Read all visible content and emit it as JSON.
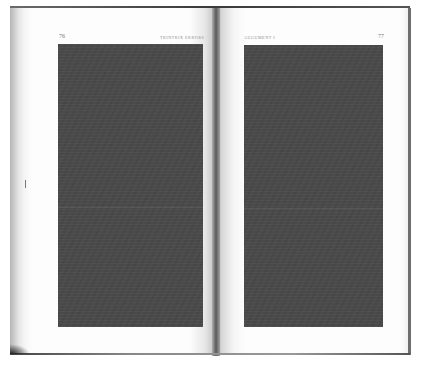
{
  "document": {
    "type": "scanned-book-spread",
    "left_page": {
      "page_number": "76",
      "running_head": "TRINTRIX ERRORS",
      "text_block": "redacted"
    },
    "right_page": {
      "page_number": "77",
      "running_head": "AUGUMENT I",
      "text_block": "redacted"
    }
  },
  "colors": {
    "page": "#fdfdfd",
    "text_block": "#4a4a4a",
    "edge": "#6e6e6e"
  }
}
